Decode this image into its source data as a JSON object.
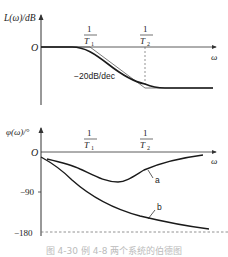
{
  "magnitude_plot": {
    "y_label": "L(ω)/dB",
    "x_label": "ω",
    "origin_label": "O",
    "corner1_num": "1",
    "corner1_den": "T",
    "corner1_sub": "1",
    "corner2_num": "1",
    "corner2_den": "T",
    "corner2_sub": "2",
    "slope_label": "−20dB/dec"
  },
  "phase_plot": {
    "y_label": "φ(ω)/°",
    "x_label": "ω",
    "origin_label": "O",
    "tick_90": "−90",
    "tick_180": "−180",
    "corner1_num": "1",
    "corner1_den": "T",
    "corner1_sub": "1",
    "corner2_num": "1",
    "corner2_den": "T",
    "corner2_sub": "2",
    "curve_a_label": "a",
    "curve_b_label": "b"
  },
  "caption": "图 4-30  例 4-8 两个系统的伯德图",
  "colors": {
    "line": "#1a1a1a",
    "axis": "#333333",
    "dashed": "#666666"
  }
}
